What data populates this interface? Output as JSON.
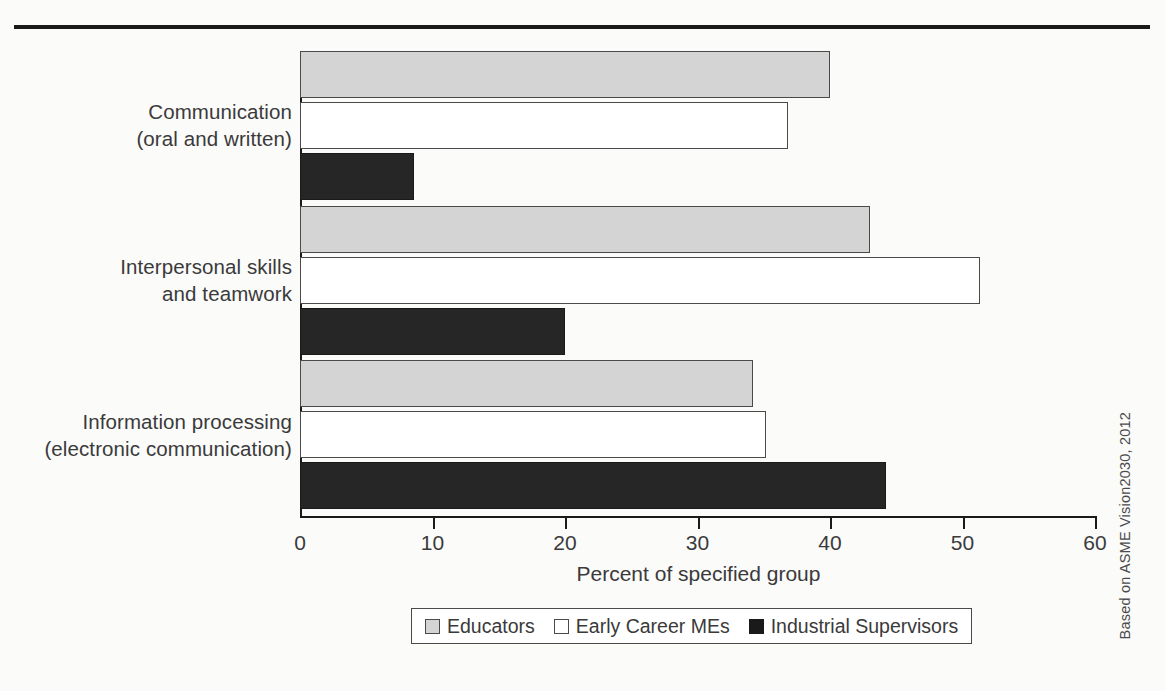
{
  "figure": {
    "credit": "Based on ASME Vision2030, 2012"
  },
  "chart_data": {
    "type": "bar",
    "orientation": "horizontal",
    "title": "",
    "xlabel": "Percent of specified group",
    "ylabel": "",
    "xlim": [
      0,
      60
    ],
    "xticks": [
      0,
      10,
      20,
      30,
      40,
      50,
      60
    ],
    "xtick_labels": [
      "0",
      "10",
      "20",
      "30",
      "40",
      "50",
      "60"
    ],
    "grid": false,
    "legend_position": "bottom",
    "categories": [
      "Communication\n(oral and written)",
      "Interpersonal skills\nand teamwork",
      "Information processing\n(electronic communication)"
    ],
    "category_lines": [
      [
        "Communication",
        "(oral and written)"
      ],
      [
        "Interpersonal skills",
        "and teamwork"
      ],
      [
        "Information processing",
        "(electronic communication)"
      ]
    ],
    "series": [
      {
        "name": "Educators",
        "color": "#d4d4d4",
        "values": [
          40.0,
          43.0,
          34.2
        ]
      },
      {
        "name": "Early Career MEs",
        "color": "#ffffff",
        "values": [
          36.8,
          51.3,
          35.2
        ]
      },
      {
        "name": "Industrial Supervisors",
        "color": "#262626",
        "values": [
          8.6,
          20.0,
          44.2
        ]
      }
    ]
  }
}
